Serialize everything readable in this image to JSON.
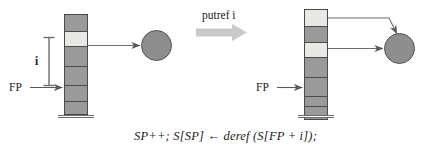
{
  "figure": {
    "caption": "SP++; S[SP] ← deref (S[FP + i]);",
    "transition_label": "putref i",
    "colors": {
      "cell_fill": "#9a9a9a",
      "cell_fill_highlight": "#e8e8e4",
      "cell_border": "#4a4a4a",
      "heap_fill": "#8e8e8e",
      "heap_border": "#545454",
      "arrow": "#5a5a5a",
      "block_arrow": "#c9c9c9",
      "text": "#1a1a1a"
    }
  },
  "before": {
    "name": "before-state",
    "stack": {
      "name": "stack-before",
      "cells": [
        {
          "id": "cell-b0",
          "fill": "normal"
        },
        {
          "id": "cell-b1",
          "fill": "highlight"
        },
        {
          "id": "cell-b2",
          "fill": "normal"
        },
        {
          "id": "cell-b3",
          "fill": "normal"
        },
        {
          "id": "cell-b4",
          "fill": "normal"
        },
        {
          "id": "cell-b5",
          "fill": "normal"
        }
      ]
    },
    "fp_label": "FP",
    "offset_label": "i",
    "heap_cell": {
      "name": "heap-cell-before"
    }
  },
  "after": {
    "name": "after-state",
    "stack": {
      "name": "stack-after",
      "cells": [
        {
          "id": "cell-a0",
          "fill": "highlight"
        },
        {
          "id": "cell-a1",
          "fill": "normal"
        },
        {
          "id": "cell-a2",
          "fill": "highlight"
        },
        {
          "id": "cell-a3",
          "fill": "normal"
        },
        {
          "id": "cell-a4",
          "fill": "normal"
        },
        {
          "id": "cell-a5",
          "fill": "normal"
        },
        {
          "id": "cell-a6",
          "fill": "normal"
        }
      ]
    },
    "fp_label": "FP",
    "heap_cell": {
      "name": "heap-cell-after"
    }
  }
}
